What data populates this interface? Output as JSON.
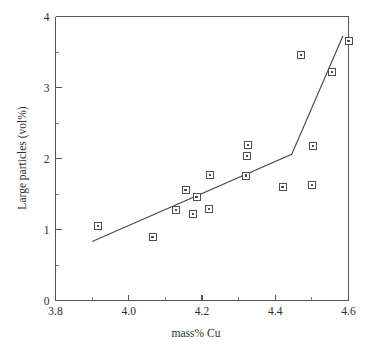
{
  "chart_data": {
    "type": "scatter",
    "title": "",
    "xlabel": "mass% Cu",
    "ylabel": "Large particles (vol%)",
    "xlim": [
      3.8,
      4.6
    ],
    "ylim": [
      0,
      4
    ],
    "grid": false,
    "legend": null,
    "xticks": [
      3.8,
      4.0,
      4.2,
      4.4,
      4.6
    ],
    "xtick_labels": [
      "3.8",
      "4.0",
      "4.2",
      "4.4",
      "4.6"
    ],
    "xminor_ticks": [
      3.9,
      4.1,
      4.3,
      4.5
    ],
    "yticks": [
      0,
      1,
      2,
      3,
      4
    ],
    "ytick_labels": [
      "0",
      "1",
      "2",
      "3",
      "4"
    ],
    "yminor_ticks": [
      0.5,
      1.5,
      2.5,
      3.5
    ],
    "marker": "open-square-with-center-dot",
    "points": [
      {
        "x": 3.915,
        "y": 1.055
      },
      {
        "x": 4.065,
        "y": 0.9
      },
      {
        "x": 4.13,
        "y": 1.27
      },
      {
        "x": 4.155,
        "y": 1.56
      },
      {
        "x": 4.175,
        "y": 1.22
      },
      {
        "x": 4.185,
        "y": 1.46
      },
      {
        "x": 4.22,
        "y": 1.29
      },
      {
        "x": 4.222,
        "y": 1.77
      },
      {
        "x": 4.32,
        "y": 1.76
      },
      {
        "x": 4.322,
        "y": 2.04
      },
      {
        "x": 4.325,
        "y": 2.19
      },
      {
        "x": 4.42,
        "y": 1.6
      },
      {
        "x": 4.47,
        "y": 3.46
      },
      {
        "x": 4.5,
        "y": 1.63
      },
      {
        "x": 4.502,
        "y": 2.18
      },
      {
        "x": 4.555,
        "y": 3.22
      },
      {
        "x": 4.6,
        "y": 3.66
      }
    ],
    "trend_line": {
      "style": "solid-piecewise",
      "vertices": [
        {
          "x": 3.9,
          "y": 0.83
        },
        {
          "x": 4.445,
          "y": 2.06
        },
        {
          "x": 4.585,
          "y": 3.73
        }
      ]
    }
  }
}
